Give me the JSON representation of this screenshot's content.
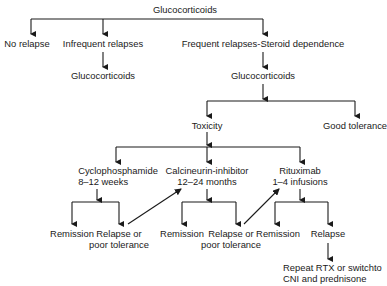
{
  "diagram": {
    "nodes": {
      "root": "Glucocorticoids",
      "no_relapse": "No relapse",
      "infrequent": "Infrequent relapses",
      "infrequent_gc": "Glucocorticoids",
      "frequent": "Frequent relapses-Steroid dependence",
      "frequent_gc": "Glucocorticoids",
      "toxicity": "Toxicity",
      "good_tolerance": "Good tolerance",
      "cyclo": {
        "line1": "Cyclophosphamide",
        "line2": "8–12 weeks"
      },
      "cni": {
        "line1": "Calcineurin-inhibitor",
        "line2": "12–24 months"
      },
      "rtx": {
        "line1": "Rituximab",
        "line2": "1–4 infusions"
      },
      "cyclo_remission": "Remission",
      "cyclo_relapse": {
        "line1": "Relapse or",
        "line2": "poor tolerance"
      },
      "cni_remission": "Remission",
      "cni_relapse": {
        "line1": "Relapse or",
        "line2": "poor tolerance"
      },
      "rtx_remission": "Remission",
      "rtx_relapse": "Relapse",
      "final": {
        "line1": "Repeat RTX or switchto",
        "line2": "CNI and prednisone"
      }
    },
    "colors": {
      "line": "#1a1a1a",
      "text": "#1a1a1a",
      "background": "#ffffff"
    }
  }
}
